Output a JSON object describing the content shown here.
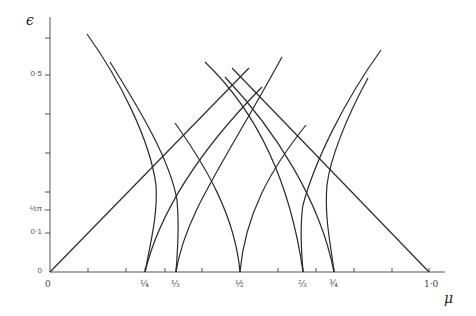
{
  "figure": {
    "y_axis_symbol": "ϵ",
    "x_axis_symbol": "μ"
  },
  "y_axis": {
    "labels": [
      {
        "text": "0·5",
        "y": 75
      },
      {
        "text": "½π",
        "y": 210
      },
      {
        "text": "0·1",
        "y": 233
      },
      {
        "text": "0",
        "y": 272
      }
    ],
    "ticks_y": [
      38,
      75,
      114,
      153,
      192,
      210,
      233
    ]
  },
  "x_axis": {
    "labels": [
      {
        "text": "0",
        "x": 50
      },
      {
        "text": "¼",
        "x": 145
      },
      {
        "text": "⅓",
        "x": 176
      },
      {
        "text": "½",
        "x": 240
      },
      {
        "text": "⅔",
        "x": 303
      },
      {
        "text": "¾",
        "x": 334
      },
      {
        "text": "1·0",
        "x": 429
      }
    ],
    "ticks_x": [
      88,
      126,
      145,
      165,
      176,
      202,
      240,
      278,
      303,
      316,
      334,
      354,
      392,
      429
    ]
  },
  "colors": {
    "line": "#2b2b2b",
    "axis": "#555555"
  },
  "curves": [
    {
      "name": "origin-line",
      "d": "M50,272 L249,68"
    },
    {
      "name": "right-descending-line",
      "d": "M232,68 L429,272"
    },
    {
      "name": "left-outer-curve",
      "d": "M87,34 C120,80 150,140 156,185 C158,215 150,245 145,272"
    },
    {
      "name": "left-inner-curve",
      "d": "M110,62 C140,110 170,160 177,200 C180,230 177,255 176,272"
    },
    {
      "name": "quarter-rising",
      "d": "M145,272 C160,210 200,150 262,87"
    },
    {
      "name": "third-rising",
      "d": "M176,272 C185,215 220,170 282,57"
    },
    {
      "name": "third-desc-to-half",
      "d": "M175,123 C205,165 235,215 240,272"
    },
    {
      "name": "half-rising",
      "d": "M240,272 C245,215 270,170 306,125"
    },
    {
      "name": "desc-to-twothirds",
      "d": "M205,62 C255,110 290,180 303,272"
    },
    {
      "name": "desc-to-threequarter",
      "d": "M225,77 C275,130 320,200 334,272"
    },
    {
      "name": "right-outer-curve",
      "d": "M381,50 C345,100 315,160 303,205 C299,230 302,255 303,272"
    },
    {
      "name": "right-inner-curve",
      "d": "M368,78 C345,120 330,160 327,185 C324,220 332,250 334,272"
    }
  ]
}
